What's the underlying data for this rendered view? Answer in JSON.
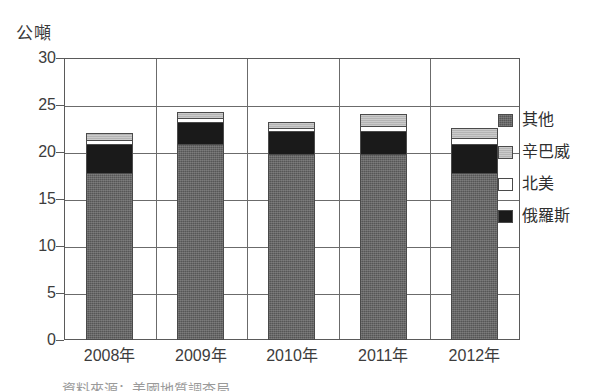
{
  "chart_data": {
    "type": "bar",
    "subtype": "stacked-vertical",
    "title": "",
    "xlabel": "",
    "ylabel": "公噸",
    "ylim": [
      0,
      30
    ],
    "yticks": [
      0,
      5,
      10,
      15,
      20,
      25,
      30
    ],
    "ytick_labels": [
      "0",
      "5",
      "10",
      "15",
      "20",
      "25",
      "30"
    ],
    "grid": true,
    "grid_axis": "both",
    "legend_position": "right",
    "categories": [
      "2008年",
      "2009年",
      "2010年",
      "2011年",
      "2012年"
    ],
    "series": [
      {
        "name": "其他",
        "color": "#565656",
        "values": [
          17.6,
          20.6,
          19.6,
          19.6,
          17.6
        ]
      },
      {
        "name": "俄羅斯",
        "color": "#1a1a1a",
        "values": [
          3.0,
          2.4,
          2.4,
          2.4,
          3.0
        ]
      },
      {
        "name": "北美",
        "color": "#ffffff",
        "values": [
          0.5,
          0.4,
          0.3,
          0.6,
          0.7
        ]
      },
      {
        "name": "辛巴威",
        "color": "#b4b4b4",
        "values": [
          0.7,
          0.7,
          0.7,
          1.2,
          1.0
        ]
      }
    ],
    "stack_order_bottom_to_top": [
      "其他",
      "俄羅斯",
      "北美",
      "辛巴威"
    ],
    "totals": [
      21.8,
      24.1,
      23.0,
      23.8,
      22.3
    ]
  },
  "legend": {
    "items": [
      {
        "label": "其他",
        "swatch": "dark-gray-textured"
      },
      {
        "label": "辛巴威",
        "swatch": "light-gray"
      },
      {
        "label": "北美",
        "swatch": "white"
      },
      {
        "label": "俄羅斯",
        "swatch": "black"
      }
    ]
  },
  "caption": {
    "clipped_text": "資料來源：美國地質調查局"
  }
}
